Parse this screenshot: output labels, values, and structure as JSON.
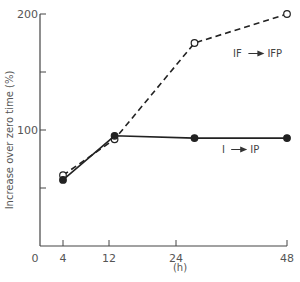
{
  "chart_data": {
    "type": "line",
    "title": "",
    "xlabel": "(h)",
    "ylabel": "Increase over zero time (%)",
    "xlim": [
      0,
      48
    ],
    "ylim": [
      0,
      200
    ],
    "x_ticks": [
      0,
      4,
      12,
      24,
      48
    ],
    "x_tick_labels": [
      "0",
      "4",
      "12",
      "24",
      "48"
    ],
    "y_ticks": [
      50,
      100,
      150,
      200
    ],
    "y_tick_labels": [
      "",
      "100",
      "",
      "200"
    ],
    "grid": false,
    "legend_position": "inline-annotations",
    "series": [
      {
        "name": "IF → IFP",
        "label_left": "IF",
        "label_right": "IFP",
        "style": "dashed",
        "marker": "open-circle",
        "x": [
          4,
          13,
          28,
          48
        ],
        "values": [
          61,
          92,
          175,
          200
        ]
      },
      {
        "name": "I → IP",
        "label_left": "I",
        "label_right": "IP",
        "style": "solid",
        "marker": "filled-circle",
        "x": [
          4,
          13,
          28,
          48
        ],
        "values": [
          57,
          95,
          93,
          93
        ]
      }
    ]
  },
  "colors": {
    "line": "#222222",
    "axis": "#444444",
    "text": "#555555"
  }
}
